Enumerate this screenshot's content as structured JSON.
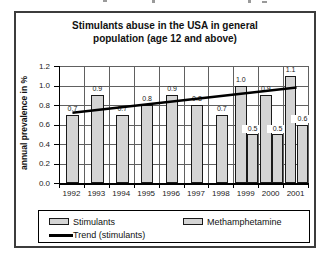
{
  "chart_data": {
    "type": "bar",
    "title": "Stimulants abuse in the USA in general population (age 12 and above)",
    "title_lines": [
      "Stimulants abuse in the USA in general",
      "population (age 12 and above)"
    ],
    "ylabel": "annual prevalence in %",
    "xlabel": "",
    "categories": [
      "1992",
      "1993",
      "1994",
      "1995",
      "1996",
      "1997",
      "1998",
      "1999",
      "2000",
      "2001"
    ],
    "series": [
      {
        "name": "Stimulants",
        "values": [
          0.7,
          0.9,
          0.7,
          0.8,
          0.9,
          0.8,
          0.7,
          1.0,
          0.9,
          1.1
        ],
        "labels": [
          "0.7",
          "0.9",
          "0.7",
          "0.8",
          "0.9",
          "0.8",
          "0.7",
          "1.0",
          "0.9",
          "1.1"
        ]
      },
      {
        "name": "Methamphetamine",
        "values": [
          null,
          null,
          null,
          null,
          null,
          null,
          null,
          0.5,
          0.5,
          0.6
        ],
        "labels": [
          null,
          null,
          null,
          null,
          null,
          null,
          null,
          "0.5",
          "0.5",
          "0.6"
        ]
      }
    ],
    "trendline": {
      "name": "Trend (stimulants)",
      "start_value": 0.72,
      "end_value": 0.98
    },
    "ylim": [
      0,
      1.2
    ],
    "ytick_step": 0.2,
    "ytick_labels": [
      "1.2",
      "1.0",
      "0.8",
      "0.6",
      "0.4",
      "0.2",
      "0.0"
    ],
    "grid": true,
    "legend_position": "bottom",
    "colors": {
      "bar_fill": "#d4d4d4",
      "bar_border": "#1a1a1a",
      "grid": "#606060",
      "trend": "#000000"
    }
  },
  "legend": {
    "items": [
      {
        "label": "Stimulants",
        "swatch": "bar"
      },
      {
        "label": "Methamphetamine",
        "swatch": "bar"
      },
      {
        "label": "Trend (stimulants)",
        "swatch": "line"
      }
    ]
  }
}
